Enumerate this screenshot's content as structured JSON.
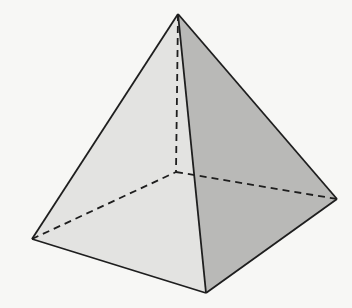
{
  "diagram": {
    "type": "square-pyramid",
    "vertices": {
      "apex": [
        178,
        14
      ],
      "left": [
        32,
        239
      ],
      "front": [
        206,
        293
      ],
      "right": [
        337,
        199
      ],
      "back_hidden": [
        176,
        172
      ]
    },
    "colors": {
      "background": "#f7f7f5",
      "left_face": "#e3e3e1",
      "right_face": "#b9b9b7",
      "stroke": "#1e1e1e"
    },
    "edges": {
      "visible": [
        [
          "apex",
          "left"
        ],
        [
          "apex",
          "front"
        ],
        [
          "apex",
          "right"
        ],
        [
          "left",
          "front"
        ],
        [
          "front",
          "right"
        ]
      ],
      "hidden": [
        [
          "apex",
          "back_hidden"
        ],
        [
          "left",
          "back_hidden"
        ],
        [
          "back_hidden",
          "right"
        ]
      ]
    }
  }
}
